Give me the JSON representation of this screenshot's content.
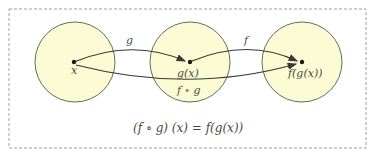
{
  "colors": {
    "circle_fill": "#fbfbd6",
    "circle_stroke": "#6b6b55",
    "arrow": "#3a3a30",
    "frame": "#a0a0a0",
    "text": "#4a4a3a"
  },
  "sets": [
    {
      "name": "domain-x",
      "point_label": "x"
    },
    {
      "name": "middle-gx",
      "point_label": "g(x)"
    },
    {
      "name": "codomain-fgx",
      "point_label": "f(g(x))"
    }
  ],
  "arrows": [
    {
      "name": "g",
      "label": "g",
      "from": "x",
      "to": "g(x)"
    },
    {
      "name": "f",
      "label": "f",
      "from": "g(x)",
      "to": "f(g(x))"
    },
    {
      "name": "composite",
      "label": "f ∘ g",
      "from": "x",
      "to": "f(g(x))"
    }
  ],
  "equation": "(f ∘ g) (x) = f(g(x))"
}
